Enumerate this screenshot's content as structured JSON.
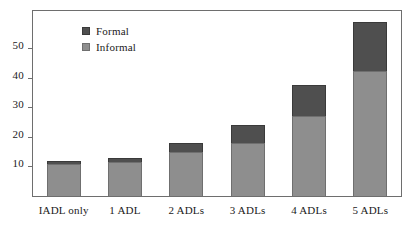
{
  "chart_data": {
    "type": "bar",
    "stacked": true,
    "title": "",
    "subtitle": "",
    "xlabel": "",
    "ylabel": "",
    "categories": [
      "IADL only",
      "1 ADL",
      "2 ADLs",
      "3 ADLs",
      "4 ADLs",
      "5 ADLs"
    ],
    "series": [
      {
        "name": "Informal",
        "color": "#8e8e8e",
        "values": [
          11,
          11.5,
          15,
          18,
          27,
          42.5
        ]
      },
      {
        "name": "Formal",
        "color": "#4f4f4f",
        "values": [
          1,
          1.5,
          3,
          6,
          10.5,
          16.5
        ]
      }
    ],
    "totals": [
      12,
      13,
      18,
      24,
      37.5,
      59
    ],
    "ylim": [
      0,
      63
    ],
    "yticks": [
      10,
      20,
      30,
      40,
      50
    ],
    "ytick_labels": [
      "10",
      "20",
      "30",
      "40",
      "50"
    ],
    "grid": false,
    "legend_position": "upper-left-inside",
    "legend_entries": [
      "Formal",
      "Informal"
    ]
  }
}
